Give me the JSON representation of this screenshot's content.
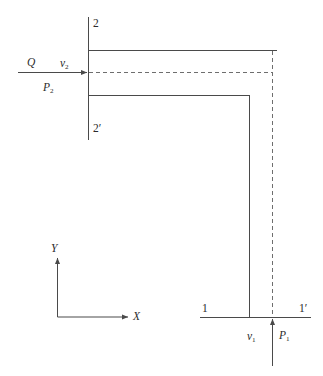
{
  "figure": {
    "stroke_color": "#4a4a4a",
    "dash_color": "#6e6e6e",
    "labels": {
      "flow_rate": "Q",
      "inlet_velocity": "v",
      "inlet_velocity_sub": "2",
      "inlet_pressure": "P",
      "inlet_pressure_sub": "2",
      "outlet_velocity": "v",
      "outlet_velocity_sub": "1",
      "outlet_pressure": "P",
      "outlet_pressure_sub": "1",
      "section_2": "2",
      "section_2_prime": "2′",
      "section_1": "1",
      "section_1_prime": "1′",
      "axis_x": "X",
      "axis_y": "Y"
    }
  }
}
